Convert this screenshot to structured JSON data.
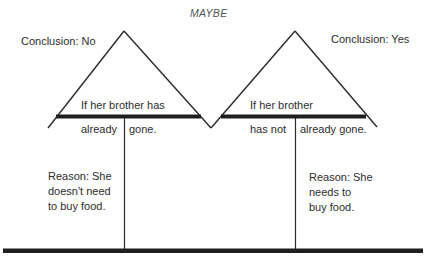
{
  "title": "MAYBE",
  "left": {
    "conclusion": "Conclusion: No",
    "condition_top": "If her brother has",
    "condition_bottom_left": "already",
    "condition_bottom_right": "gone.",
    "reason_lines": [
      "Reason: She",
      "doesn't need",
      "to buy food."
    ]
  },
  "right": {
    "conclusion": "Conclusion: Yes",
    "condition_top": "If her brother",
    "condition_bottom_left": "has not",
    "condition_bottom_right": "already gone.",
    "reason_lines": [
      "Reason: She",
      "needs to",
      "buy food."
    ]
  },
  "colors": {
    "line": "#2a2a2a",
    "bar": "#1f1f1f",
    "background": "#ffffff"
  }
}
